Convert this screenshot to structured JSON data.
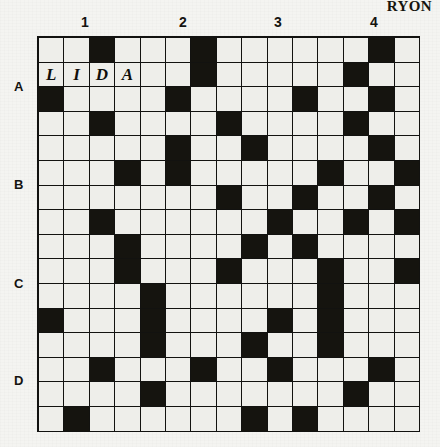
{
  "puzzle": {
    "corner_word": "RYON",
    "column_headers": [
      "1",
      "2",
      "3",
      "4"
    ],
    "column_header_x": [
      47,
      145,
      240,
      336
    ],
    "row_headers": [
      "A",
      "B",
      "C",
      "D"
    ],
    "row_header_y": [
      50,
      148,
      247,
      344
    ],
    "columns": 15,
    "rows": 16,
    "colors": {
      "ink": "#15140f",
      "cell_fill": "#eeeeea",
      "paper": "#f4f4f1"
    },
    "grid": [
      [
        0,
        0,
        1,
        0,
        0,
        0,
        1,
        0,
        0,
        0,
        0,
        0,
        0,
        1,
        0
      ],
      [
        0,
        0,
        0,
        0,
        0,
        0,
        1,
        0,
        0,
        0,
        0,
        0,
        1,
        0,
        0
      ],
      [
        1,
        0,
        0,
        0,
        0,
        1,
        0,
        0,
        0,
        0,
        1,
        0,
        0,
        1,
        0
      ],
      [
        0,
        0,
        1,
        0,
        0,
        0,
        0,
        1,
        0,
        0,
        0,
        0,
        1,
        0,
        0
      ],
      [
        0,
        0,
        0,
        0,
        0,
        1,
        0,
        0,
        1,
        0,
        0,
        0,
        0,
        1,
        0
      ],
      [
        0,
        0,
        0,
        1,
        0,
        1,
        0,
        0,
        0,
        0,
        0,
        1,
        0,
        0,
        1
      ],
      [
        0,
        0,
        0,
        0,
        0,
        0,
        0,
        1,
        0,
        0,
        1,
        0,
        0,
        1,
        0
      ],
      [
        0,
        0,
        1,
        0,
        0,
        0,
        0,
        0,
        0,
        1,
        0,
        0,
        1,
        0,
        1
      ],
      [
        0,
        0,
        0,
        1,
        0,
        0,
        0,
        0,
        1,
        0,
        1,
        0,
        0,
        0,
        0
      ],
      [
        0,
        0,
        0,
        1,
        0,
        0,
        0,
        1,
        0,
        0,
        0,
        1,
        0,
        0,
        1
      ],
      [
        0,
        0,
        0,
        0,
        1,
        0,
        0,
        0,
        0,
        0,
        0,
        1,
        0,
        0,
        0
      ],
      [
        1,
        0,
        0,
        0,
        1,
        0,
        0,
        0,
        0,
        1,
        0,
        1,
        0,
        0,
        0
      ],
      [
        0,
        0,
        0,
        0,
        1,
        0,
        0,
        0,
        1,
        0,
        0,
        1,
        0,
        0,
        0
      ],
      [
        0,
        0,
        1,
        0,
        0,
        0,
        1,
        0,
        0,
        1,
        0,
        0,
        0,
        1,
        0
      ],
      [
        0,
        0,
        0,
        0,
        1,
        0,
        0,
        0,
        0,
        0,
        0,
        0,
        1,
        0,
        0
      ],
      [
        0,
        1,
        0,
        0,
        0,
        0,
        0,
        0,
        1,
        0,
        1,
        0,
        0,
        0,
        0
      ]
    ],
    "filled_letters": [
      {
        "row": 1,
        "col": 0,
        "letter": "L"
      },
      {
        "row": 1,
        "col": 1,
        "letter": "I"
      },
      {
        "row": 1,
        "col": 2,
        "letter": "D"
      },
      {
        "row": 1,
        "col": 3,
        "letter": "A"
      }
    ]
  }
}
